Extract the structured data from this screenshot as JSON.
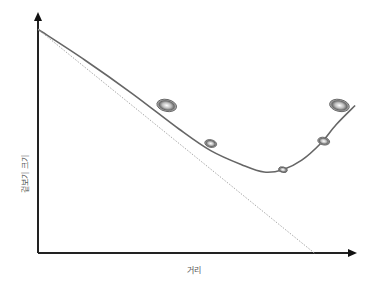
{
  "diagram": {
    "xlabel": "거리",
    "ylabel": "겉보기 크기",
    "colors": {
      "axis": "#222222",
      "curve": "#666666",
      "dotted": "#aaaaaa",
      "object_fill": "#bbbbbb",
      "object_stroke": "#555555"
    }
  },
  "chart_data": {
    "type": "line",
    "title": "",
    "xlabel": "거리",
    "ylabel": "겉보기 크기",
    "xlim": [
      0,
      1
    ],
    "ylim": [
      0,
      1
    ],
    "grid": false,
    "ticks": false,
    "series": [
      {
        "name": "apparent-size-curve",
        "style": "solid",
        "x": [
          0.0,
          0.15,
          0.3,
          0.45,
          0.55,
          0.65,
          0.72,
          0.78,
          0.84,
          0.9,
          0.95,
          1.01
        ],
        "y": [
          0.94,
          0.81,
          0.67,
          0.52,
          0.43,
          0.37,
          0.34,
          0.35,
          0.39,
          0.46,
          0.54,
          0.62
        ]
      },
      {
        "name": "linear-extrapolation",
        "style": "dotted",
        "x": [
          0.0,
          0.88
        ],
        "y": [
          0.94,
          0.0
        ]
      }
    ],
    "objects": [
      {
        "name": "galaxy-1",
        "x": 0.41,
        "y": 0.62,
        "size": "large"
      },
      {
        "name": "galaxy-2",
        "x": 0.55,
        "y": 0.46,
        "size": "small"
      },
      {
        "name": "galaxy-3",
        "x": 0.78,
        "y": 0.35,
        "size": "smallest"
      },
      {
        "name": "galaxy-4",
        "x": 0.91,
        "y": 0.47,
        "size": "small"
      },
      {
        "name": "galaxy-5",
        "x": 0.96,
        "y": 0.62,
        "size": "large"
      }
    ]
  }
}
